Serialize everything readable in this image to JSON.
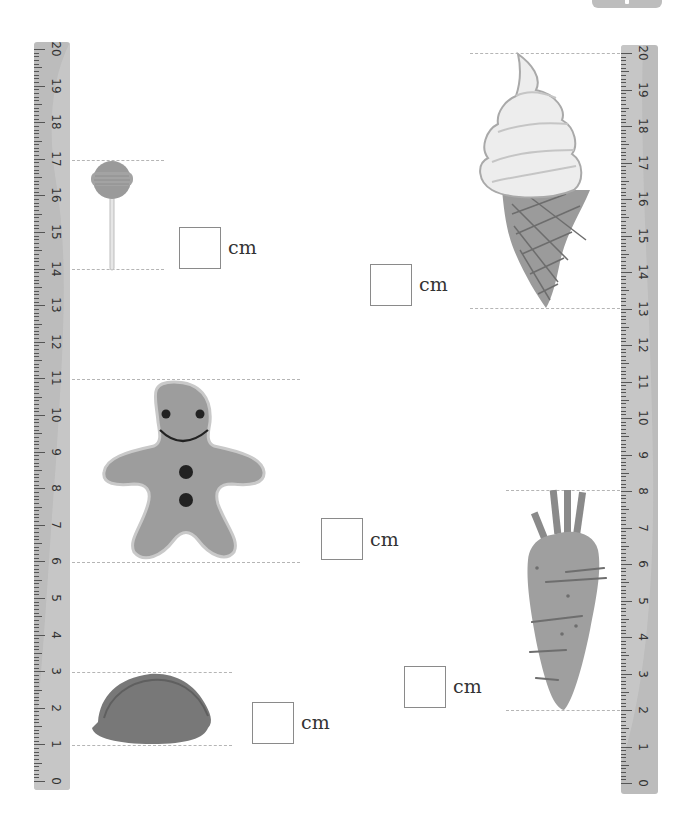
{
  "page": {
    "badge": "page-tab",
    "unit_label": "cm",
    "colors": {
      "ruler": "#bcbcbc",
      "ruler_shade": "#cfcfcf",
      "tick": "#555555",
      "dashed_guide": "#b5b5b5",
      "answer_box_border": "#8a8a8a"
    }
  },
  "rulers": {
    "left": {
      "min": 0,
      "max": 20,
      "labels": [
        "0",
        "1",
        "2",
        "3",
        "4",
        "5",
        "6",
        "7",
        "8",
        "9",
        "10",
        "11",
        "12",
        "13",
        "14",
        "15",
        "16",
        "17",
        "18",
        "19",
        "20"
      ]
    },
    "right": {
      "min": 0,
      "max": 20,
      "labels": [
        "0",
        "1",
        "2",
        "3",
        "4",
        "5",
        "6",
        "7",
        "8",
        "9",
        "10",
        "11",
        "12",
        "13",
        "14",
        "15",
        "16",
        "17",
        "18",
        "19",
        "20"
      ]
    }
  },
  "items": [
    {
      "name": "lollipop",
      "ruler": "left",
      "top_cm": 17,
      "bottom_cm": 14,
      "answer": "",
      "unit": "cm"
    },
    {
      "name": "gingerbread-man",
      "ruler": "left",
      "top_cm": 11,
      "bottom_cm": 6,
      "answer": "",
      "unit": "cm"
    },
    {
      "name": "dumpling",
      "ruler": "left",
      "top_cm": 3,
      "bottom_cm": 1,
      "answer": "",
      "unit": "cm"
    },
    {
      "name": "ice-cream-cone",
      "ruler": "right",
      "top_cm": 20,
      "bottom_cm": 13,
      "answer": "",
      "unit": "cm"
    },
    {
      "name": "carrot",
      "ruler": "right",
      "top_cm": 8,
      "bottom_cm": 2,
      "answer": "",
      "unit": "cm"
    }
  ]
}
